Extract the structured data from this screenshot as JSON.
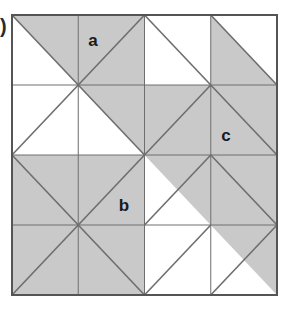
{
  "figure": {
    "caption_mark": ")",
    "colors": {
      "shade": "#c9c9c9",
      "white": "#ffffff",
      "grid_line": "#6e6e6e",
      "diagonal_line": "#6e6e6e",
      "outer_border": "#555555",
      "label_text": "#1a1a1a",
      "background": "#ffffff"
    },
    "geometry": {
      "x0": 12,
      "y0": 15,
      "x1": 277,
      "y1": 295,
      "rows": 4,
      "cols": 4,
      "cell_width": 66.25,
      "cell_height": 70
    },
    "labels": [
      {
        "name": "label-a",
        "text": "a",
        "x": 93,
        "y": 46
      },
      {
        "name": "label-b",
        "text": "b",
        "x": 124,
        "y": 211
      },
      {
        "name": "label-c",
        "text": "c",
        "x": 226,
        "y": 141
      }
    ],
    "cells": [
      {
        "row": 1,
        "col": 1,
        "diagonal": "main",
        "shaded": "upper-right"
      },
      {
        "row": 1,
        "col": 2,
        "diagonal": "anti",
        "shaded": "full"
      },
      {
        "row": 1,
        "col": 3,
        "diagonal": "main",
        "shaded": "none"
      },
      {
        "row": 1,
        "col": 4,
        "diagonal": "main",
        "shaded": "lower-left"
      },
      {
        "row": 2,
        "col": 1,
        "diagonal": "anti",
        "shaded": "none"
      },
      {
        "row": 2,
        "col": 2,
        "diagonal": "main",
        "shaded": "upper-right"
      },
      {
        "row": 2,
        "col": 3,
        "diagonal": "anti",
        "shaded": "full"
      },
      {
        "row": 2,
        "col": 4,
        "diagonal": "main",
        "shaded": "full"
      },
      {
        "row": 3,
        "col": 1,
        "diagonal": "main",
        "shaded": "full"
      },
      {
        "row": 3,
        "col": 2,
        "diagonal": "anti",
        "shaded": "full"
      },
      {
        "row": 3,
        "col": 3,
        "diagonal": "anti",
        "shaded": "upper-right"
      },
      {
        "row": 3,
        "col": 4,
        "diagonal": "main",
        "shaded": "full"
      },
      {
        "row": 4,
        "col": 1,
        "diagonal": "anti",
        "shaded": "full"
      },
      {
        "row": 4,
        "col": 2,
        "diagonal": "main",
        "shaded": "full"
      },
      {
        "row": 4,
        "col": 3,
        "diagonal": "anti",
        "shaded": "none"
      },
      {
        "row": 4,
        "col": 4,
        "diagonal": "anti",
        "shaded": "upper-right"
      }
    ]
  }
}
